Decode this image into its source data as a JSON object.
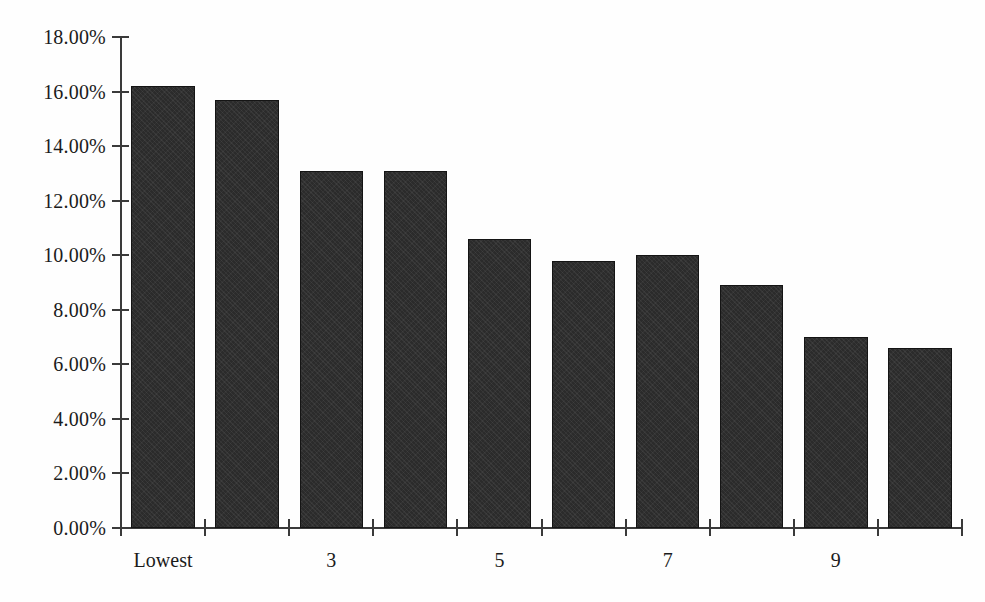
{
  "chart_data": {
    "type": "bar",
    "title": "",
    "subtitle": "",
    "xlabel": "",
    "ylabel": "",
    "categories": [
      "Lowest",
      "2",
      "3",
      "4",
      "5",
      "6",
      "7",
      "8",
      "9",
      "10"
    ],
    "tick_labels": [
      "Lowest",
      "",
      "3",
      "",
      "5",
      "",
      "7",
      "",
      "9",
      ""
    ],
    "values": [
      16.2,
      15.7,
      13.1,
      13.1,
      10.6,
      9.8,
      10.0,
      8.9,
      7.0,
      6.6
    ],
    "value_labels": [
      "16.20%",
      "15.70%",
      "13.10%",
      "13.10%",
      "10.60%",
      "9.80%",
      "10.00%",
      "8.90%",
      "7.00%",
      "6.60%"
    ],
    "ylim": [
      0,
      18
    ],
    "ytick_values": [
      0,
      2,
      4,
      6,
      8,
      10,
      12,
      14,
      16,
      18
    ],
    "ytick_labels": [
      "0.00%",
      "2.00%",
      "4.00%",
      "6.00%",
      "8.00%",
      "10.00%",
      "12.00%",
      "14.00%",
      "16.00%",
      "18.00%"
    ],
    "grid": false,
    "legend": null,
    "legend_position": "none",
    "bar_color": "#2b2b2b",
    "axis_color": "#3a3a3a",
    "background_color": "#fefefe",
    "text_color": "#1b1b1b"
  }
}
